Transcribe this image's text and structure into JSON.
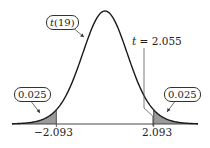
{
  "chart_data": {
    "type": "area",
    "title": "",
    "distribution": "t(19)",
    "degrees_of_freedom": 19,
    "xlabel": "",
    "ylabel": "",
    "grid": false,
    "legend": null,
    "critical_values": [
      -2.093,
      2.093
    ],
    "tail_areas": {
      "left": 0.025,
      "right": 0.025
    },
    "shaded_regions": [
      {
        "from": "-inf",
        "to": -2.093,
        "area": 0.025
      },
      {
        "from": 2.093,
        "to": "inf",
        "area": 0.025
      }
    ],
    "observed_statistic": {
      "label": "t = 2.055",
      "value": 2.055
    },
    "annotations": [
      "t(19)",
      "0.025",
      "0.025",
      "t = 2.055"
    ],
    "tick_labels": [
      "−2.093",
      "2.093"
    ],
    "x_range": [
      -4,
      4
    ]
  },
  "labels": {
    "dist_label_italic": "t",
    "dist_label_rest": "(19)",
    "left_tail": "0.025",
    "right_tail": "0.025",
    "stat_italic": "t",
    "stat_rest": " = 2.055",
    "left_tick": "−2.093",
    "right_tick": "2.093"
  },
  "colors": {
    "curve": "#1a1a1a",
    "shade": "#9a9a9a",
    "axis": "#333333"
  }
}
